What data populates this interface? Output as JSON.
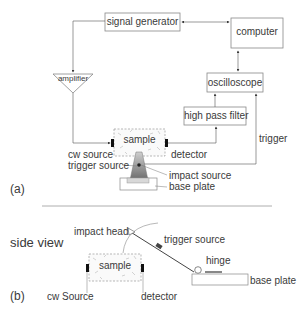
{
  "panel_a": {
    "tag": "(a)",
    "blocks": {
      "signal_generator": "signal generator",
      "computer": "computer",
      "amplifier": "amplifier",
      "oscilloscope": "oscilloscope",
      "high_pass_filter": "high pass filter",
      "sample": "sample"
    },
    "labels": {
      "cw_source": "cw source",
      "detector": "detector",
      "trigger": "trigger",
      "trigger_source": "trigger source",
      "impact_source": "impact source",
      "base_plate": "base plate"
    }
  },
  "panel_b": {
    "tag": "(b)",
    "title": "side view",
    "labels": {
      "impact_head": "impact head",
      "trigger_source": "trigger source",
      "sample": "sample",
      "hinge": "hinge",
      "base_plate": "base plate",
      "cw_source": "cw Source",
      "detector": "detector"
    }
  },
  "colors": {
    "line": "#555555",
    "box_border": "#888888",
    "transducer": "#111111",
    "impact_fill": "#6e6e6e"
  }
}
